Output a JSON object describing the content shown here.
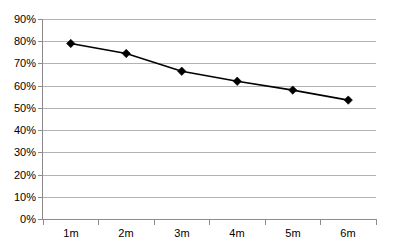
{
  "chart_data": {
    "type": "line",
    "title": "",
    "subtitle": "",
    "xlabel": "",
    "ylabel": "",
    "categories": [
      "1m",
      "2m",
      "3m",
      "4m",
      "5m",
      "6m"
    ],
    "values": [
      79,
      74.5,
      66.5,
      62,
      58,
      53.5
    ],
    "series": [
      {
        "name": "",
        "values": [
          79,
          74.5,
          66.5,
          62,
          58,
          53.5
        ]
      }
    ],
    "ylim": [
      0,
      90
    ],
    "ytick_values": [
      0,
      10,
      20,
      30,
      40,
      50,
      60,
      70,
      80,
      90
    ],
    "ytick_labels": [
      "0%",
      "10%",
      "20%",
      "30%",
      "40%",
      "50%",
      "60%",
      "70%",
      "80%",
      "90%"
    ],
    "xtick_labels": [
      "1m",
      "2m",
      "3m",
      "4m",
      "5m",
      "6m"
    ],
    "grid": "horizontal",
    "legend": "none",
    "line_color": "#000000",
    "marker_shape": "diamond",
    "marker_color": "#000000",
    "gridline_color": "#b3b3b3",
    "axis_color": "#8c8c8c",
    "background_color": "#ffffff"
  }
}
